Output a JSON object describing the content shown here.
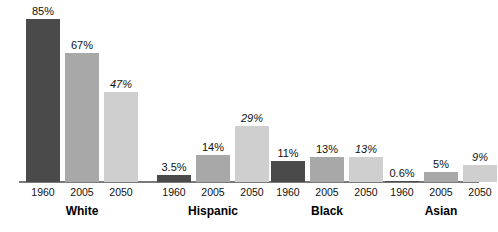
{
  "chart_data": {
    "type": "bar",
    "title": "",
    "subtitle": "",
    "xlabel": "",
    "ylabel": "",
    "ylim": [
      0,
      88
    ],
    "grid": false,
    "legend_position": "none",
    "categories": [
      "White",
      "Hispanic",
      "Black",
      "Asian"
    ],
    "x": [
      "1960",
      "2005",
      "2050"
    ],
    "series": [
      {
        "name": "1960",
        "tone": "tone-dark",
        "values": [
          85,
          3.5,
          11,
          0.6
        ],
        "labels": [
          "85%",
          "3.5%",
          "11%",
          "0.6%"
        ],
        "projected": false
      },
      {
        "name": "2005",
        "tone": "tone-mid",
        "values": [
          67,
          14,
          13,
          5
        ],
        "labels": [
          "67%",
          "14%",
          "13%",
          "5%"
        ],
        "projected": false
      },
      {
        "name": "2050",
        "tone": "tone-light",
        "values": [
          47,
          29,
          13,
          9
        ],
        "labels": [
          "47%",
          "29%",
          "13%",
          "9%"
        ],
        "projected": true
      }
    ],
    "annotations": [
      "2050 values shown in italics indicate projections"
    ],
    "colors": {
      "bar_1960": "#4a4a4a",
      "bar_2005": "#a8a8a8",
      "bar_2050": "#cfcfcf",
      "axis": "#7a7a7a",
      "text": "#111111",
      "background": "#ffffff"
    }
  },
  "groups": [
    {
      "label": "White",
      "bars": [
        {
          "year": "1960",
          "label": "85%",
          "value": 85,
          "tone": "tone-dark",
          "projected": false
        },
        {
          "year": "2005",
          "label": "67%",
          "value": 67,
          "tone": "tone-mid",
          "projected": false
        },
        {
          "year": "2050",
          "label": "47%",
          "value": 47,
          "tone": "tone-light",
          "projected": true
        }
      ]
    },
    {
      "label": "Hispanic",
      "bars": [
        {
          "year": "1960",
          "label": "3.5%",
          "value": 3.5,
          "tone": "tone-dark",
          "projected": false
        },
        {
          "year": "2005",
          "label": "14%",
          "value": 14,
          "tone": "tone-mid",
          "projected": false
        },
        {
          "year": "2050",
          "label": "29%",
          "value": 29,
          "tone": "tone-light",
          "projected": true
        }
      ]
    },
    {
      "label": "Black",
      "bars": [
        {
          "year": "1960",
          "label": "11%",
          "value": 11,
          "tone": "tone-dark",
          "projected": false
        },
        {
          "year": "2005",
          "label": "13%",
          "value": 13,
          "tone": "tone-mid",
          "projected": false
        },
        {
          "year": "2050",
          "label": "13%",
          "value": 13,
          "tone": "tone-light",
          "projected": true
        }
      ]
    },
    {
      "label": "Asian",
      "bars": [
        {
          "year": "1960",
          "label": "0.6%",
          "value": 0.6,
          "tone": "tone-dark",
          "projected": false
        },
        {
          "year": "2005",
          "label": "5%",
          "value": 5,
          "tone": "tone-mid",
          "projected": false
        },
        {
          "year": "2050",
          "label": "9%",
          "value": 9,
          "tone": "tone-light",
          "projected": true
        }
      ]
    }
  ],
  "layout": {
    "group_left": [
      26,
      157,
      271,
      385
    ],
    "group_width": 112,
    "bar_width": 34,
    "bar_gap": 5,
    "baseline_y": 181,
    "px_per_percent": 1.92
  }
}
